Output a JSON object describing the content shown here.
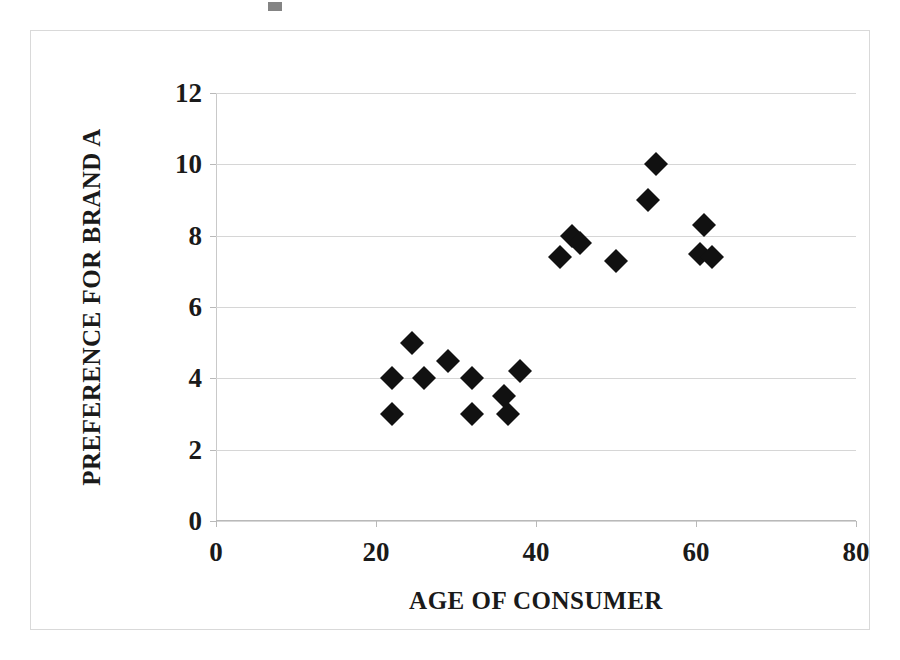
{
  "chart_data": {
    "type": "scatter",
    "title": "",
    "xlabel": "AGE OF CONSUMER",
    "ylabel": "PREFERENCE FOR BRAND A",
    "xlim": [
      0,
      80
    ],
    "ylim": [
      0,
      12
    ],
    "xticks": [
      0,
      20,
      40,
      60,
      80
    ],
    "yticks": [
      0,
      2,
      4,
      6,
      8,
      10,
      12
    ],
    "xtick_labels": [
      "0",
      "20",
      "40",
      "60",
      "80"
    ],
    "ytick_labels": [
      "0",
      "2",
      "4",
      "6",
      "8",
      "10",
      "12"
    ],
    "grid": "horizontal",
    "legend": "none",
    "marker": "filled-diamond",
    "marker_color": "#111111",
    "points": [
      {
        "x": 22,
        "y": 4.0
      },
      {
        "x": 22,
        "y": 3.0
      },
      {
        "x": 24.5,
        "y": 5.0
      },
      {
        "x": 26,
        "y": 4.0
      },
      {
        "x": 29,
        "y": 4.5
      },
      {
        "x": 32,
        "y": 4.0
      },
      {
        "x": 32,
        "y": 3.0
      },
      {
        "x": 36,
        "y": 3.5
      },
      {
        "x": 36.5,
        "y": 3.0
      },
      {
        "x": 38,
        "y": 4.2
      },
      {
        "x": 43,
        "y": 7.4
      },
      {
        "x": 44.5,
        "y": 8.0
      },
      {
        "x": 45.5,
        "y": 7.8
      },
      {
        "x": 50,
        "y": 7.3
      },
      {
        "x": 54,
        "y": 9.0
      },
      {
        "x": 55,
        "y": 10.0
      },
      {
        "x": 61,
        "y": 8.3
      },
      {
        "x": 60.5,
        "y": 7.5
      },
      {
        "x": 62,
        "y": 7.4
      }
    ]
  },
  "axes": {
    "x_title": "AGE OF CONSUMER",
    "y_title": "PREFERENCE FOR BRAND A"
  },
  "ticks": {
    "y": [
      "12",
      "10",
      "8",
      "6",
      "4",
      "2",
      "0"
    ],
    "x": [
      "0",
      "20",
      "40",
      "60",
      "80"
    ]
  },
  "style": {
    "frame_color": "#d9d9d9",
    "grid_color": "#d6d6d6",
    "marker_color": "#111111",
    "text_color": "#1a1a1a",
    "background": "#ffffff"
  }
}
